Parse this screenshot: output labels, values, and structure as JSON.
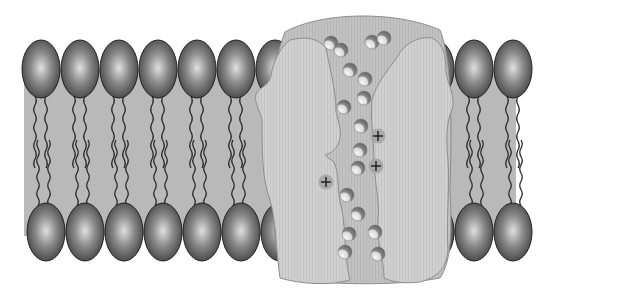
{
  "diagram": {
    "colors": {
      "background": "#ffffff",
      "bilayer_band": "#b9b9b9",
      "lipid_head_light": "#e0e0e0",
      "lipid_head_mid": "#8a8a8a",
      "lipid_head_dark": "#3a3a3a",
      "lipid_tail": "#2a2a2a",
      "protein_back": "#c6c6c6",
      "protein_front": "#d2d2d2",
      "protein_outline": "#8e8e8e",
      "channel": "#c2c2c2",
      "ion_light": "#f2f2f2",
      "ion_dark": "#6a6a6a",
      "charge_fill": "#a5a5a5",
      "charge_sign": "#1a1a1a"
    },
    "bilayer": {
      "x": 24,
      "width": 492,
      "top": 70,
      "bottom": 236,
      "top_heads_cy": 69,
      "bottom_heads_cy": 232,
      "head_rx": 19,
      "head_ry": 29,
      "top_heads_x": [
        41,
        80,
        119,
        158,
        197,
        236,
        275,
        474,
        513
      ],
      "top_heads_x_right_extra": [
        435,
        396
      ],
      "bottom_heads_x": [
        46,
        85,
        124,
        163,
        202,
        241,
        280,
        435,
        474,
        513,
        398
      ],
      "tail_columns_x": [
        41,
        80,
        119,
        158,
        197,
        236,
        396,
        435,
        474,
        513
      ]
    },
    "protein": {
      "label": "channel protein",
      "x_range": [
        255,
        455
      ],
      "y_range": [
        14,
        282
      ]
    },
    "ions": [
      {
        "cx": 331,
        "cy": 43,
        "r": 7
      },
      {
        "cx": 341,
        "cy": 50,
        "r": 7
      },
      {
        "cx": 372,
        "cy": 42,
        "r": 7
      },
      {
        "cx": 384,
        "cy": 38,
        "r": 7
      },
      {
        "cx": 350,
        "cy": 70,
        "r": 7
      },
      {
        "cx": 365,
        "cy": 79,
        "r": 7
      },
      {
        "cx": 364,
        "cy": 98,
        "r": 7
      },
      {
        "cx": 344,
        "cy": 107,
        "r": 7
      },
      {
        "cx": 361,
        "cy": 126,
        "r": 7
      },
      {
        "cx": 360,
        "cy": 150,
        "r": 7
      },
      {
        "cx": 358,
        "cy": 168,
        "r": 7
      },
      {
        "cx": 347,
        "cy": 195,
        "r": 7
      },
      {
        "cx": 358,
        "cy": 214,
        "r": 7
      },
      {
        "cx": 349,
        "cy": 234,
        "r": 7
      },
      {
        "cx": 375,
        "cy": 232,
        "r": 7
      },
      {
        "cx": 345,
        "cy": 252,
        "r": 7
      },
      {
        "cx": 378,
        "cy": 254,
        "r": 7
      }
    ],
    "charges": [
      {
        "sign": "+",
        "cx": 378,
        "cy": 136
      },
      {
        "sign": "+",
        "cx": 376,
        "cy": 166
      },
      {
        "sign": "+",
        "cx": 326,
        "cy": 182
      }
    ]
  }
}
